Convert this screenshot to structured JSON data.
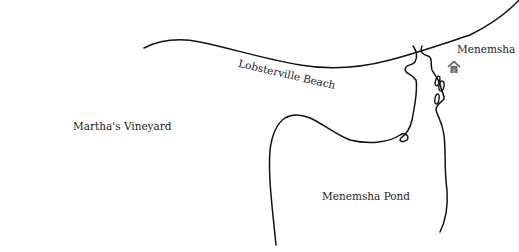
{
  "map": {
    "labels": {
      "beach": "Lobsterville Beach",
      "town": "Menemsha",
      "island": "Martha's Vineyard",
      "pond": "Menemsha Pond"
    },
    "icons": {
      "town_marker": "house-icon"
    },
    "colors": {
      "line": "#111111",
      "background": "#ffffff",
      "house": "#6b6b6b"
    }
  }
}
